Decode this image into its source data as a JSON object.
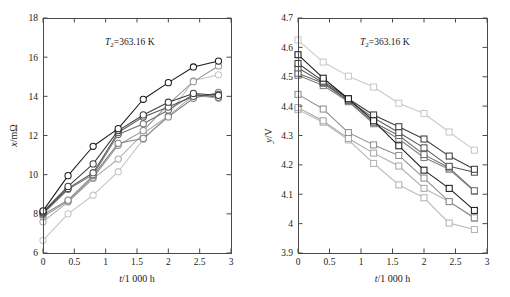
{
  "figure": {
    "panels": [
      {
        "id": "left",
        "annotation_prefix": "T",
        "annotation_sub": "2",
        "annotation_suffix": "=363.16 K",
        "xlabel_italic": "t",
        "xlabel_rest": "/1 000 h",
        "ylabel_italic": "x",
        "ylabel_rest": "/mΩ"
      },
      {
        "id": "right",
        "annotation_prefix": "T",
        "annotation_sub": "2",
        "annotation_suffix": "=363.16 K",
        "xlabel_italic": "t",
        "xlabel_rest": "/1 000 h",
        "ylabel_italic": "y",
        "ylabel_rest": "/V"
      }
    ]
  },
  "chart_data": [
    {
      "type": "line",
      "panel": "left",
      "title": "",
      "annotation": "T2=363.16 K",
      "xlabel": "t/1 000 h",
      "ylabel": "x/mΩ",
      "xlim": [
        0,
        3
      ],
      "ylim": [
        6,
        18
      ],
      "xticks": [
        0,
        0.5,
        1,
        1.5,
        2,
        2.5,
        3
      ],
      "xticklabels": [
        "0",
        "0.5",
        "1",
        "1.5",
        "2",
        "2.5",
        "3"
      ],
      "yticks": [
        6,
        8,
        10,
        12,
        14,
        16,
        18
      ],
      "yticklabels": [
        "6",
        "8",
        "10",
        "12",
        "14",
        "16",
        "18"
      ],
      "grid": false,
      "legend": "none",
      "marker": "circle",
      "x": [
        0,
        0.4,
        0.8,
        1.2,
        1.6,
        2.0,
        2.4,
        2.8
      ],
      "series": [
        {
          "name": "cell-1",
          "color": "#1a1a1a",
          "values": [
            8.15,
            9.95,
            11.45,
            12.35,
            13.85,
            14.7,
            15.5,
            15.8
          ]
        },
        {
          "name": "cell-2",
          "color": "#3d3d3d",
          "values": [
            8.1,
            9.4,
            10.55,
            12.25,
            13.05,
            13.7,
            14.15,
            14.05
          ]
        },
        {
          "name": "cell-3",
          "color": "#555555",
          "values": [
            8.05,
            9.3,
            10.1,
            12.15,
            12.95,
            13.45,
            14.0,
            14.1
          ]
        },
        {
          "name": "cell-4",
          "color": "#6e6e6e",
          "values": [
            8.0,
            9.25,
            10.0,
            12.05,
            12.6,
            13.3,
            14.1,
            13.95
          ]
        },
        {
          "name": "cell-5",
          "color": "#828282",
          "values": [
            7.95,
            8.7,
            9.95,
            11.6,
            11.85,
            12.95,
            13.9,
            14.2
          ]
        },
        {
          "name": "cell-6",
          "color": "#969696",
          "values": [
            7.85,
            8.65,
            9.85,
            11.5,
            12.25,
            13.6,
            14.75,
            15.55
          ]
        },
        {
          "name": "cell-7",
          "color": "#aaaaaa",
          "values": [
            7.6,
            8.6,
            9.8,
            10.8,
            12.1,
            13.0,
            14.05,
            13.9
          ]
        },
        {
          "name": "cell-8",
          "color": "#c4c4c4",
          "values": [
            6.65,
            8.0,
            8.95,
            10.15,
            11.8,
            13.05,
            14.8,
            15.1
          ]
        }
      ]
    },
    {
      "type": "line",
      "panel": "right",
      "title": "",
      "annotation": "T2=363.16 K",
      "xlabel": "t/1 000 h",
      "ylabel": "y/V",
      "xlim": [
        0,
        3
      ],
      "ylim": [
        3.9,
        4.7
      ],
      "xticks": [
        0,
        0.5,
        1,
        1.5,
        2,
        2.5,
        3
      ],
      "xticklabels": [
        "0",
        "0.5",
        "1",
        "1.5",
        "2",
        "2.5",
        "3"
      ],
      "yticks": [
        3.9,
        4.0,
        4.1,
        4.2,
        4.3,
        4.4,
        4.5,
        4.6,
        4.7
      ],
      "yticklabels": [
        "3.9",
        "4",
        "4.1",
        "4.2",
        "4.3",
        "4.4",
        "4.5",
        "4.6",
        "4.7"
      ],
      "grid": false,
      "legend": "none",
      "marker": "square",
      "x": [
        0,
        0.4,
        0.8,
        1.2,
        1.6,
        2.0,
        2.4,
        2.8
      ],
      "series": [
        {
          "name": "cell-1",
          "color": "#1a1a1a",
          "values": [
            4.575,
            4.495,
            4.425,
            4.35,
            4.265,
            4.182,
            4.12,
            4.045
          ]
        },
        {
          "name": "cell-2",
          "color": "#3d3d3d",
          "values": [
            4.545,
            4.485,
            4.425,
            4.37,
            4.33,
            4.288,
            4.23,
            4.185
          ]
        },
        {
          "name": "cell-3",
          "color": "#555555",
          "values": [
            4.53,
            4.48,
            4.42,
            4.36,
            4.31,
            4.258,
            4.195,
            4.175
          ]
        },
        {
          "name": "cell-4",
          "color": "#6e6e6e",
          "values": [
            4.512,
            4.478,
            4.418,
            4.345,
            4.3,
            4.235,
            4.19,
            4.112
          ]
        },
        {
          "name": "cell-5",
          "color": "#828282",
          "values": [
            4.505,
            4.47,
            4.415,
            4.34,
            4.288,
            4.225,
            4.185,
            4.11
          ]
        },
        {
          "name": "cell-6",
          "color": "#8e8e8e",
          "values": [
            4.44,
            4.39,
            4.31,
            4.268,
            4.232,
            4.155,
            4.075,
            4.02
          ]
        },
        {
          "name": "cell-7",
          "color": "#a8a8a8",
          "values": [
            4.395,
            4.35,
            4.29,
            4.24,
            4.196,
            4.12,
            4.075,
            4.018
          ]
        },
        {
          "name": "cell-8",
          "color": "#b4b4b4",
          "values": [
            4.388,
            4.345,
            4.285,
            4.205,
            4.132,
            4.088,
            4.002,
            3.98
          ]
        },
        {
          "name": "cell-9",
          "color": "#c9c9c9",
          "values": [
            4.625,
            4.55,
            4.502,
            4.465,
            4.41,
            4.375,
            4.312,
            4.25
          ]
        }
      ]
    }
  ]
}
